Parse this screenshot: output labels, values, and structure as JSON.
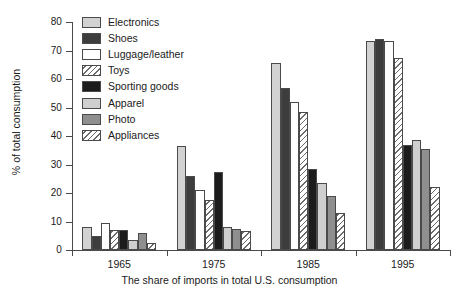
{
  "chart_data": {
    "type": "bar",
    "title": "",
    "xlabel": "The share of imports in total U.S. consumption",
    "ylabel": "% of total consumption",
    "categories": [
      "1965",
      "1975",
      "1985",
      "1995"
    ],
    "ylim": [
      0,
      80
    ],
    "yticks": [
      0,
      10,
      20,
      30,
      40,
      50,
      60,
      70,
      80
    ],
    "grid": false,
    "legend_position": "top-left inside plot",
    "series": [
      {
        "name": "Electronics",
        "values": [
          8,
          36.5,
          65.5,
          73.5
        ],
        "fill": "light-gray",
        "color": "#d2d2d2"
      },
      {
        "name": "Shoes",
        "values": [
          5,
          26,
          57,
          74
        ],
        "fill": "dark-gray",
        "color": "#3d3d3d"
      },
      {
        "name": "Luggage/leather",
        "values": [
          9.5,
          21,
          52,
          73.5
        ],
        "fill": "white",
        "color": "#ffffff"
      },
      {
        "name": "Toys",
        "values": [
          7,
          17.5,
          48.5,
          67.5
        ],
        "fill": "hatched",
        "color": "#ffffff"
      },
      {
        "name": "Sporting goods",
        "values": [
          7,
          27.5,
          28.5,
          37
        ],
        "fill": "black",
        "color": "#1c1c1c"
      },
      {
        "name": "Apparel",
        "values": [
          3.5,
          8,
          23.5,
          38.5
        ],
        "fill": "mid-gray",
        "color": "#cfcfcf"
      },
      {
        "name": "Photo",
        "values": [
          6,
          7.5,
          19,
          35.5
        ],
        "fill": "medium-gray",
        "color": "#8f8f8f"
      },
      {
        "name": "Appliances",
        "values": [
          2.5,
          6.5,
          13,
          22
        ],
        "fill": "hatched",
        "color": "#ffffff"
      }
    ]
  },
  "legend": {
    "items": [
      {
        "label": "Electronics"
      },
      {
        "label": "Shoes"
      },
      {
        "label": "Luggage/leather"
      },
      {
        "label": "Toys"
      },
      {
        "label": "Sporting goods"
      },
      {
        "label": "Apparel"
      },
      {
        "label": "Photo"
      },
      {
        "label": "Appliances"
      }
    ]
  }
}
